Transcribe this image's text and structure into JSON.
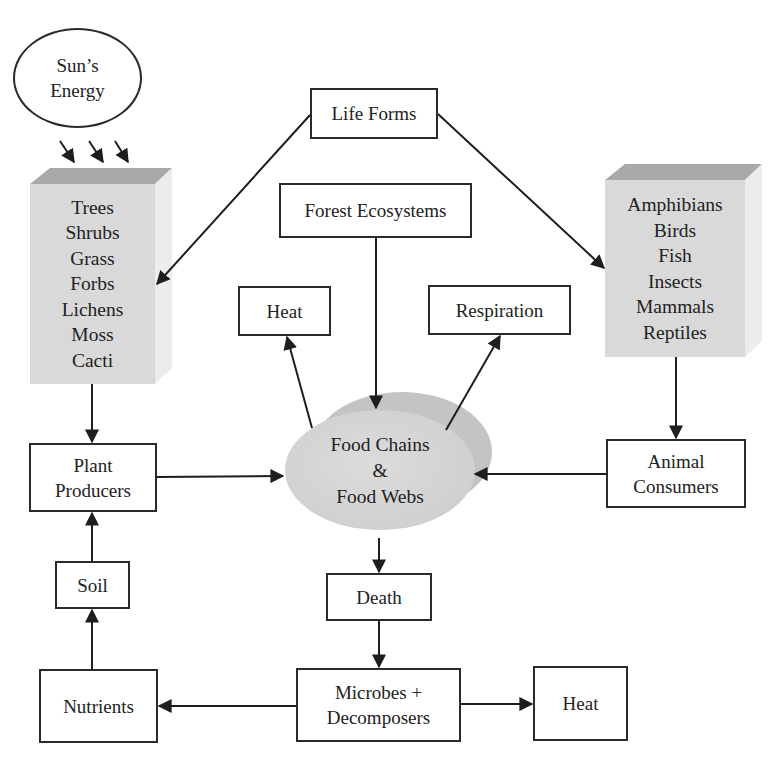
{
  "diagram": {
    "sun": {
      "line1": "Sun’s",
      "line2": "Energy"
    },
    "life_forms": "Life Forms",
    "forest_ecosystems": "Forest Ecosystems",
    "plants_block": {
      "items": [
        "Trees",
        "Shrubs",
        "Grass",
        "Forbs",
        "Lichens",
        "Moss",
        "Cacti"
      ]
    },
    "animals_block": {
      "items": [
        "Amphibians",
        "Birds",
        "Fish",
        "Insects",
        "Mammals",
        "Reptiles"
      ]
    },
    "heat_top": "Heat",
    "respiration": "Respiration",
    "food_web": {
      "line1": "Food Chains",
      "line2": "&",
      "line3": "Food Webs"
    },
    "plant_producers": {
      "line1": "Plant",
      "line2": "Producers"
    },
    "animal_consumers": {
      "line1": "Animal",
      "line2": "Consumers"
    },
    "soil": "Soil",
    "death": "Death",
    "nutrients": "Nutrients",
    "microbes": {
      "line1": "Microbes +",
      "line2": "Decomposers"
    },
    "heat_bottom": "Heat"
  },
  "colors": {
    "block_fill": "#d9d9d9",
    "block_top": "#a9a9a9",
    "block_side": "#ececec",
    "line": "#1e1e1e"
  }
}
